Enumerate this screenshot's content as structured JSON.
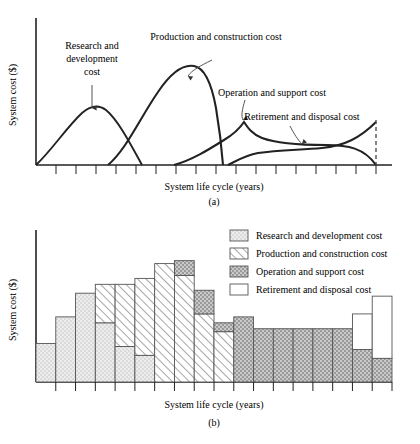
{
  "figure": {
    "axis_y_label": "System cost ($)",
    "axis_x_label": "System life cycle (years)",
    "caption_a": "(a)",
    "caption_b": "(b)"
  },
  "panel_a": {
    "annotations": [
      {
        "name": "research-and-development",
        "lines": [
          "Research and",
          "development",
          "cost"
        ]
      },
      {
        "name": "production-and-construction",
        "lines": [
          "Production and construction cost"
        ]
      },
      {
        "name": "operation-and-support",
        "lines": [
          "Operation and support cost"
        ]
      },
      {
        "name": "retirement-and-disposal",
        "lines": [
          "Retirement and disposal cost"
        ]
      }
    ]
  },
  "legend": {
    "items": [
      {
        "name": "research-and-development",
        "label": "Research and development cost",
        "pattern": "light-stipple",
        "color": "#e8e8e8"
      },
      {
        "name": "production-and-construction",
        "label": "Production and construction cost",
        "pattern": "diagonal-hatch",
        "color": "#ffffff"
      },
      {
        "name": "operation-and-support",
        "label": "Operation and support cost",
        "pattern": "dark-stipple",
        "color": "#bdbdbd"
      },
      {
        "name": "retirement-and-disposal",
        "label": "Retirement and disposal cost",
        "pattern": "solid-white",
        "color": "#ffffff"
      }
    ]
  },
  "chart_data": [
    {
      "type": "line",
      "name": "life-cycle-cost-curves",
      "title": "(a)",
      "xlabel": "System life cycle (years)",
      "ylabel": "System cost ($)",
      "xlim": [
        0,
        18
      ],
      "ylim": [
        0,
        100
      ],
      "grid": false,
      "legend_position": "inline-annotations",
      "series": [
        {
          "name": "Research and development cost",
          "x": [
            0,
            1,
            2,
            3,
            3.6,
            4.2,
            5,
            6,
            7
          ],
          "y": [
            0,
            14,
            28,
            42,
            48,
            45,
            33,
            16,
            0
          ]
        },
        {
          "name": "Production and construction cost",
          "x": [
            3.6,
            4.5,
            5.5,
            6.5,
            7.3,
            8.0,
            8.6,
            9.2,
            9.8,
            10.3
          ],
          "y": [
            0,
            18,
            48,
            76,
            90,
            88,
            74,
            52,
            24,
            0
          ]
        },
        {
          "name": "Operation and support cost",
          "x": [
            7.5,
            8.5,
            9.5,
            10.4,
            11.0,
            12.0,
            13.5,
            15.0,
            16.2,
            17.2,
            18.0
          ],
          "y": [
            0,
            10,
            18,
            26,
            33,
            28,
            26,
            26,
            26,
            22,
            0
          ]
        },
        {
          "name": "Retirement and disposal cost",
          "x": [
            10.6,
            11.2,
            12.0,
            13.0,
            14.5,
            15.5,
            16.5,
            17.3,
            18.0
          ],
          "y": [
            0,
            12,
            17,
            18,
            18,
            19,
            22,
            30,
            42
          ]
        }
      ]
    },
    {
      "type": "bar",
      "name": "life-cycle-cost-stacked-bars",
      "title": "(b)",
      "xlabel": "System life cycle (years)",
      "ylabel": "System cost ($)",
      "stacked": true,
      "grid": false,
      "legend_position": "top-right",
      "ylim": [
        0,
        100
      ],
      "categories": [
        "1",
        "2",
        "3",
        "4",
        "5",
        "6",
        "7",
        "8",
        "9",
        "10",
        "11",
        "12",
        "13",
        "14",
        "15",
        "16",
        "17",
        "18"
      ],
      "series": [
        {
          "name": "Research and development cost",
          "values": [
            26,
            44,
            60,
            40,
            24,
            18,
            0,
            0,
            0,
            0,
            0,
            0,
            0,
            0,
            0,
            0,
            0,
            0
          ]
        },
        {
          "name": "Production and construction cost",
          "values": [
            0,
            0,
            0,
            26,
            42,
            52,
            80,
            72,
            46,
            34,
            0,
            0,
            0,
            0,
            0,
            0,
            0,
            0
          ]
        },
        {
          "name": "Operation and support cost",
          "values": [
            0,
            0,
            0,
            0,
            0,
            0,
            0,
            10,
            16,
            6,
            44,
            36,
            36,
            36,
            36,
            36,
            22,
            16
          ]
        },
        {
          "name": "Retirement and disposal cost",
          "values": [
            0,
            0,
            0,
            0,
            0,
            0,
            0,
            0,
            0,
            0,
            0,
            0,
            0,
            0,
            0,
            0,
            24,
            42
          ]
        }
      ]
    }
  ]
}
